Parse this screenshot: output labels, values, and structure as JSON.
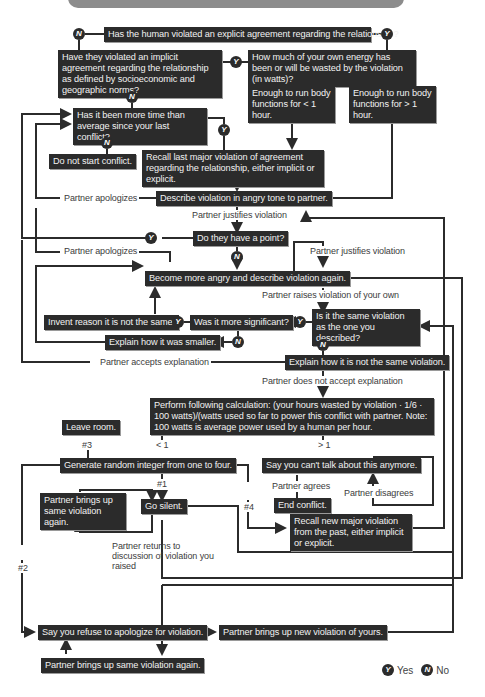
{
  "colors": {
    "node_bg": "#2b2b2b",
    "node_text": "#f2f2f2",
    "line": "#2b2b2b",
    "label_text": "#3c3c3c",
    "top_bar": "#8c8c8c"
  },
  "nodes": {
    "explicit": "Has the human violated an explicit agreement regarding the relationship?",
    "implicit": "Have they violated an implicit agreement regarding the relationship as defined by socioeconomic and geographic norms?",
    "energy": "How much of your own energy has been or will be wasted by the violation (in watts)?",
    "less_hour": "Enough to run body functions for < 1 hour.",
    "more_hour": "Enough to run body functions for > 1 hour.",
    "time_avg": "Has it been more time than average since your last conflict?",
    "no_conflict": "Do not start conflict.",
    "recall_last": "Recall last major violation of agreement regarding the relationship, either implicit or explicit.",
    "describe_angry": "Describe violation in angry tone to partner.",
    "have_point": "Do they have a point?",
    "more_angry": "Become more angry and describe violation again.",
    "same_violation": "Is it the same violation as the one you described?",
    "more_significant": "Was it more significant?",
    "invent_reason": "Invent reason it is not the same.",
    "explain_smaller": "Explain how it was smaller.",
    "explain_not_same": "Explain how it is not the same violation.",
    "calculation": "Perform following calculation: (your hours wasted by violation · 1/6 · 100 watts)/(watts used so far to power this conflict with partner. Note: 100 watts is average power used by a human per hour.",
    "leave_room": "Leave room.",
    "random_int": "Generate random integer from one to four.",
    "cant_talk": "Say you can't talk about this anymore.",
    "end_conflict": "End conflict.",
    "brings_same_1": "Partner brings up same violation again.",
    "go_silent": "Go silent.",
    "recall_new": "Recall new major violation from the past, either implicit or explicit.",
    "refuse_apologize": "Say you refuse to apologize for violation.",
    "brings_new": "Partner brings up new violation of yours.",
    "brings_same_2": "Partner brings up same violation again."
  },
  "labels": {
    "apologizes_1": "Partner apologizes",
    "justifies_1": "Partner justifies violation",
    "apologizes_2": "Partner apologizes",
    "justifies_2": "Partner justifies violation",
    "raises_own": "Partner raises violation of your own",
    "accepts": "Partner accepts explanation",
    "not_accept": "Partner does not accept explanation",
    "lt1": "< 1",
    "gt1": "> 1",
    "n3": "#3",
    "n1": "#1",
    "n4": "#4",
    "n2": "#2",
    "agrees": "Partner agrees",
    "disagrees": "Partner disagrees",
    "returns": "Partner returns to discussion of violation you raised"
  },
  "badges": {
    "yes": "Y",
    "no": "N"
  },
  "legend": {
    "yes_label": "Yes",
    "no_label": "No",
    "yes_badge": "Y",
    "no_badge": "N"
  }
}
